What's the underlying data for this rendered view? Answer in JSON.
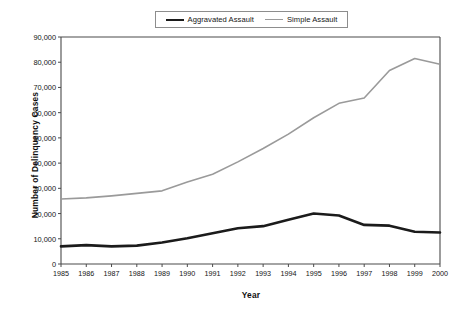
{
  "chart_data": {
    "type": "line",
    "title": "",
    "xlabel": "Year",
    "ylabel": "Number of Delinquency Cases",
    "categories": [
      "1985",
      "1986",
      "1987",
      "1988",
      "1989",
      "1990",
      "1991",
      "1992",
      "1993",
      "1994",
      "1995",
      "1996",
      "1997",
      "1998",
      "1999",
      "2000"
    ],
    "x": [
      1985,
      1986,
      1987,
      1988,
      1989,
      1990,
      1991,
      1992,
      1993,
      1994,
      1995,
      1996,
      1997,
      1998,
      1999,
      2000
    ],
    "xlim": [
      1985,
      2000
    ],
    "ylim": [
      0,
      90000
    ],
    "ytick_labels": [
      "0",
      "10,000",
      "20,000",
      "30,000",
      "40,000",
      "50,000",
      "60,000",
      "70,000",
      "80,000",
      "90,000"
    ],
    "ytick_values": [
      0,
      10000,
      20000,
      30000,
      40000,
      50000,
      60000,
      70000,
      80000,
      90000
    ],
    "grid": false,
    "legend_position": "top-center",
    "series": [
      {
        "name": "Aggravated Assault",
        "color": "#1b1b1b",
        "line_width": 2.6,
        "values": [
          7000,
          7500,
          7000,
          7300,
          8500,
          10200,
          12200,
          14200,
          15000,
          17500,
          20000,
          19200,
          15500,
          15200,
          12800,
          12500
        ]
      },
      {
        "name": "Simple Assault",
        "color": "#9a9a9a",
        "line_width": 1.6,
        "values": [
          25800,
          26200,
          27000,
          28000,
          29000,
          32500,
          35600,
          40500,
          45800,
          51500,
          58000,
          63700,
          65800,
          76700,
          81500,
          79200
        ]
      }
    ]
  },
  "legend": {
    "entries": [
      {
        "label": "Aggravated Assault"
      },
      {
        "label": "Simple Assault"
      }
    ]
  },
  "axes": {
    "x_title": "Year",
    "y_title": "Number of Delinquency Cases"
  },
  "colors": {
    "aggravated": "#1b1b1b",
    "simple": "#9a9a9a",
    "axis": "#4a4a4a",
    "background": "#ffffff"
  }
}
